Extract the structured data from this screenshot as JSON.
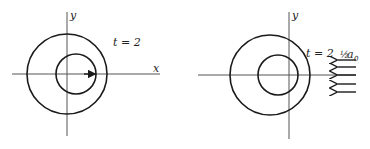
{
  "panels": [
    {
      "id": "left",
      "axis_labels": {
        "x": "x",
        "y": "y"
      },
      "time_label": "t = 2",
      "outer_circle": {
        "cx": 67,
        "cy": 74,
        "r": 40
      },
      "inner_circle": {
        "cx": 76,
        "cy": 74,
        "r": 20
      },
      "velocity_arrow": {
        "x1": 84,
        "x2": 96,
        "y": 74
      }
    },
    {
      "id": "right",
      "axis_labels": {
        "x": "",
        "y": "y"
      },
      "time_label": "t = 2",
      "outer_circle": {
        "cx": 270,
        "cy": 75,
        "r": 40
      },
      "inner_circle": {
        "cx": 278,
        "cy": 75,
        "r": 20
      },
      "field_label_fraction": "½",
      "field_label_symbol": "a",
      "field_label_subscript": "0",
      "field_arrows_y": [
        58,
        66,
        75,
        84,
        92
      ]
    }
  ]
}
